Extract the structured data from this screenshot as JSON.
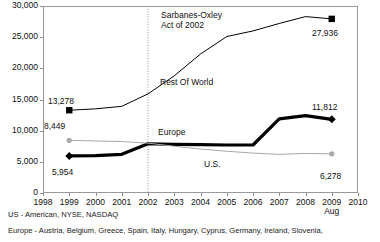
{
  "chart_data": {
    "type": "line",
    "title": "",
    "xlabel": "",
    "ylabel": "",
    "x": [
      1998,
      1999,
      2000,
      2001,
      2002,
      2003,
      2004,
      2005,
      2006,
      2007,
      2008,
      2009
    ],
    "xlim": [
      1998,
      2010
    ],
    "ylim": [
      0,
      30000
    ],
    "grid": false,
    "legend": "inline-labels",
    "xtick_labels": [
      "1998",
      "1999",
      "2000",
      "2001",
      "2002",
      "2003",
      "2004",
      "2005",
      "2006",
      "2007",
      "2008",
      "2009",
      "2010"
    ],
    "xtick_sublabel": "Aug",
    "xtick_sublabel_at": "2009",
    "ytick_labels": [
      "0",
      "5,000",
      "10,000",
      "15,000",
      "20,000",
      "25,000",
      "30,000"
    ],
    "ytick_values": [
      0,
      5000,
      10000,
      15000,
      20000,
      25000,
      30000
    ],
    "series": [
      {
        "name": "Rest Of World",
        "style": "thin-black-square",
        "color": "#000000",
        "x": [
          1999,
          2000,
          2001,
          2002,
          2003,
          2004,
          2005,
          2006,
          2007,
          2008,
          2009
        ],
        "values": [
          13278,
          13500,
          13900,
          15900,
          18800,
          22300,
          25100,
          26000,
          27200,
          28300,
          27936
        ],
        "start_label": "13,278",
        "end_label": "27,936"
      },
      {
        "name": "Europe",
        "style": "thick-black-diamond",
        "color": "#000000",
        "x": [
          1999,
          2000,
          2001,
          2002,
          2003,
          2004,
          2005,
          2006,
          2007,
          2008,
          2009
        ],
        "values": [
          5954,
          6000,
          6200,
          7900,
          7800,
          7750,
          7700,
          7700,
          11900,
          12400,
          11812
        ],
        "start_label": "5,954",
        "end_label": "11,812"
      },
      {
        "name": "U.S.",
        "style": "thin-gray-circle",
        "color": "#a8a8a8",
        "x": [
          1999,
          2000,
          2001,
          2002,
          2003,
          2004,
          2005,
          2006,
          2007,
          2008,
          2009
        ],
        "values": [
          8449,
          8350,
          8250,
          8000,
          7500,
          7050,
          6700,
          6400,
          6200,
          6350,
          6278
        ],
        "start_label": "8,449",
        "end_label": "6,278"
      }
    ],
    "annotations": [
      {
        "name": "sarbanes-oxley",
        "text_line1": "Sarbanes-Oxley",
        "text_line2": "Act of 2002",
        "at_x": 2002,
        "marker": "dotted-vertical-line"
      }
    ],
    "inline_series_labels": [
      {
        "name": "rest-of-world",
        "text": "Rest Of World"
      },
      {
        "name": "europe",
        "text": "Europe"
      },
      {
        "name": "us",
        "text": "U.S."
      }
    ]
  },
  "footnotes": [
    "US - American, NYSE, NASDAQ",
    "Europe - Austria, Belgium, Greece, Spain, Italy, Hungary, Cyprus, Germany, Ireland, Slovenia,"
  ]
}
